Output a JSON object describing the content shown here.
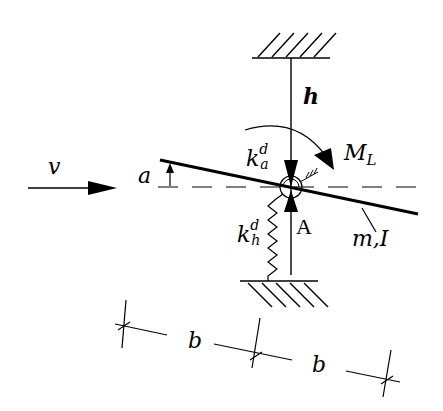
{
  "diagram": {
    "type": "mechanical schematic",
    "labels": {
      "velocity": "v",
      "angle": "a",
      "height": "h",
      "moment_main": "M",
      "moment_sub": "L",
      "torsion_spring_main": "k",
      "torsion_spring_sup": "d",
      "torsion_spring_sub": "a",
      "heave_spring_main": "k",
      "heave_spring_sup": "d",
      "heave_spring_sub": "h",
      "pivot": "A",
      "mass_inertia": "m,I",
      "dim_left": "b",
      "dim_right": "b"
    },
    "colors": {
      "stroke": "#000000",
      "background": "#ffffff"
    }
  }
}
